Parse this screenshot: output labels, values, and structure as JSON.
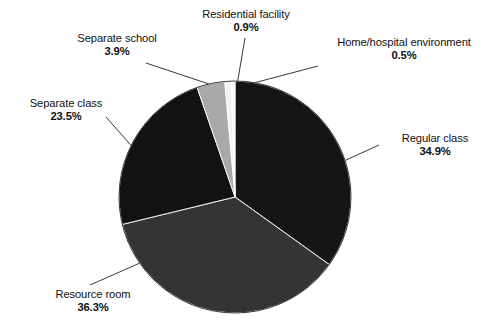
{
  "chart_data": {
    "type": "pie",
    "title": "",
    "subtitle": "",
    "xlabel": "",
    "ylabel": "",
    "legend_position": "none",
    "grid": false,
    "labels_outside": true,
    "start_angle_deg": 0,
    "direction": "clockwise",
    "categories": [
      "Regular class",
      "Resource room",
      "Separate class",
      "Separate school",
      "Residential facility",
      "Home/hospital environment"
    ],
    "values": [
      34.9,
      36.3,
      23.5,
      3.9,
      0.9,
      0.5
    ],
    "value_labels": [
      "34.9%",
      "36.3%",
      "23.5%",
      "3.9%",
      "0.9%",
      "0.5%"
    ],
    "units": "percent",
    "total": 100.0,
    "slices": [
      {
        "name": "Regular class",
        "value": 34.9,
        "value_label": "34.9%",
        "color": "#151515",
        "start_deg": 0.0,
        "end_deg": 125.64,
        "label_anchor": "right"
      },
      {
        "name": "Resource room",
        "value": 36.3,
        "value_label": "36.3%",
        "color": "#343434",
        "start_deg": 125.64,
        "end_deg": 256.32,
        "label_anchor": "bottom-left"
      },
      {
        "name": "Separate class",
        "value": 23.5,
        "value_label": "23.5%",
        "color": "#121212",
        "start_deg": 256.32,
        "end_deg": 340.92,
        "label_anchor": "left"
      },
      {
        "name": "Separate school",
        "value": 3.9,
        "value_label": "3.9%",
        "color": "#a9a9a9",
        "start_deg": 340.92,
        "end_deg": 354.96,
        "label_anchor": "top-left"
      },
      {
        "name": "Residential facility",
        "value": 0.9,
        "value_label": "0.9%",
        "color": "#f2f2f2",
        "start_deg": 354.96,
        "end_deg": 358.2,
        "label_anchor": "top"
      },
      {
        "name": "Home/hospital environment",
        "value": 0.5,
        "value_label": "0.5%",
        "color": "#fbfbfb",
        "start_deg": 358.2,
        "end_deg": 360.0,
        "label_anchor": "top-right"
      }
    ],
    "geometry": {
      "center_x": 235,
      "center_y": 197,
      "radius": 116
    },
    "colors": {
      "background": "#ffffff",
      "text": "#111111",
      "leader_line": "#3a3a3a",
      "slice_outline": "#ffffff"
    }
  },
  "labels": {
    "regular_class": {
      "name": "Regular class",
      "pct": "34.9%"
    },
    "resource_room": {
      "name": "Resource room",
      "pct": "36.3%"
    },
    "separate_class": {
      "name": "Separate class",
      "pct": "23.5%"
    },
    "separate_school": {
      "name": "Separate school",
      "pct": "3.9%"
    },
    "residential": {
      "name": "Residential facility",
      "pct": "0.9%"
    },
    "home_hospital": {
      "name": "Home/hospital environment",
      "pct": "0.5%"
    }
  }
}
